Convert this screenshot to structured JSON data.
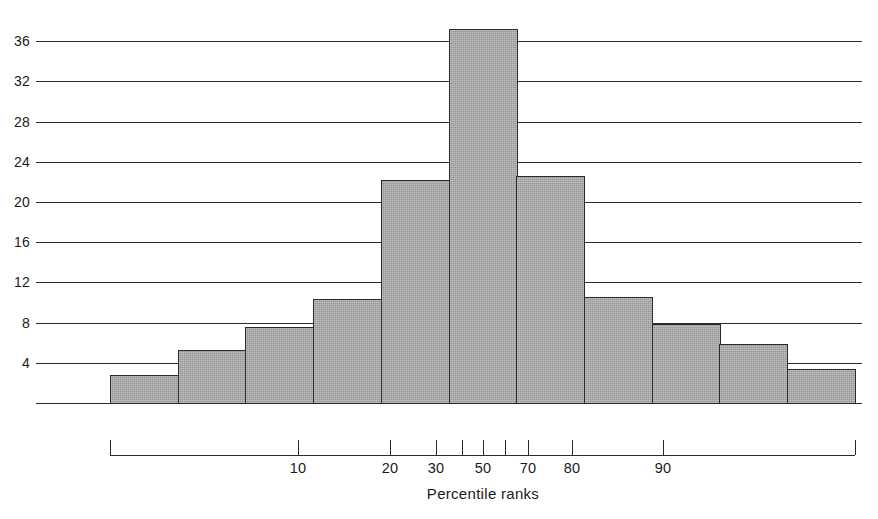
{
  "chart_data": {
    "type": "bar",
    "title": "",
    "subtitle": "",
    "xlabel": "Percentile ranks",
    "ylabel": "",
    "grid": true,
    "legend": false,
    "legend_position": "none",
    "ylim": [
      0,
      40
    ],
    "ytick_labels": [
      "4",
      "8",
      "12",
      "16",
      "20",
      "24",
      "28",
      "32",
      "36"
    ],
    "ytick_values": [
      4,
      8,
      12,
      16,
      20,
      24,
      28,
      32,
      36
    ],
    "xtick_labels": [
      "10",
      "20",
      "30",
      "50",
      "70",
      "80",
      "90"
    ],
    "xtick_values": [
      10,
      20,
      30,
      50,
      70,
      80,
      90
    ],
    "xtick_unlabeled_values": [
      40,
      60
    ],
    "categories": [
      "bin-1",
      "bin-2",
      "bin-3",
      "bin-4",
      "bin-5",
      "bin-6",
      "bin-7",
      "bin-8",
      "bin-9",
      "bin-10",
      "bin-11"
    ],
    "values": [
      2.8,
      5.3,
      7.6,
      10.3,
      22.2,
      37.2,
      22.6,
      10.5,
      7.9,
      5.9,
      3.4
    ],
    "bar_color": "#a8a8a8",
    "bar_edge_color": "#2b2b2b",
    "grid_color": "#2b2b2b"
  },
  "figure": {
    "caption": ""
  }
}
